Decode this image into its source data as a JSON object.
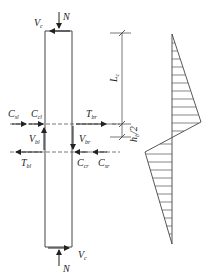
{
  "diagram": {
    "type": "beam-column joint free-body with shear diagram",
    "column_labels": {
      "top_axial": "N",
      "top_shear": "V",
      "top_shear_sub": "c",
      "bottom_axial": "N",
      "bottom_shear": "V",
      "bottom_shear_sub": "c"
    },
    "joint_forces": {
      "c_sl": {
        "main": "C",
        "sub": "sl"
      },
      "c_cl": {
        "main": "C",
        "sub": "cl"
      },
      "t_br": {
        "main": "T",
        "sub": "br"
      },
      "v_bl": {
        "main": "V",
        "sub": "bl"
      },
      "v_br": {
        "main": "V",
        "sub": "br"
      },
      "t_bl": {
        "main": "T",
        "sub": "bl"
      },
      "c_cr": {
        "main": "C",
        "sub": "cr"
      },
      "c_sr": {
        "main": "C",
        "sub": "sr"
      }
    },
    "dimensions": {
      "lc": {
        "main": "L",
        "sub": "c"
      },
      "hb2": "h",
      "hb2_sub": "b",
      "hb2_tail": "/2"
    },
    "colors": {
      "line": "#333333",
      "dash": "#555555"
    }
  }
}
